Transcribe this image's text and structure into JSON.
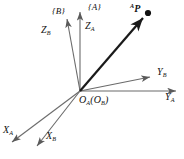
{
  "figure": {
    "background_color": "#ffffff",
    "axis_color": "#6b6b6b",
    "vector_color": "#1a1a1a",
    "text_color": "#111111",
    "width": 184,
    "height": 159
  },
  "frames": [
    {
      "id": "A",
      "label": "{A}",
      "x": 88,
      "y": 4
    },
    {
      "id": "B",
      "label": "{B}",
      "x": 52,
      "y": 7
    }
  ],
  "origin": {
    "label_o_a": "O",
    "sub_a": "A",
    "label_paren_open": "(O",
    "sub_b": "B",
    "label_paren_close": ")",
    "full_label": "OA(OB)",
    "x": 80,
    "y": 91
  },
  "point": {
    "label_sup": "A",
    "label_main": "P",
    "full_label": "AP",
    "marker_x": 148,
    "marker_y": 13,
    "label_x": 130,
    "label_y": 3
  },
  "axes": [
    {
      "name": "Z_A",
      "label_main": "Z",
      "label_sub": "A",
      "frame": "A",
      "tip_x": 80,
      "tip_y": 10,
      "label_x": 84,
      "label_y": 22
    },
    {
      "name": "Z_B",
      "label_main": "Z",
      "label_sub": "B",
      "frame": "B",
      "tip_x": 66,
      "tip_y": 16,
      "label_x": 42,
      "label_y": 26
    },
    {
      "name": "Y_A",
      "label_main": "Y",
      "label_sub": "A",
      "frame": "A",
      "tip_x": 178,
      "tip_y": 91,
      "label_x": 166,
      "label_y": 95
    },
    {
      "name": "Y_B",
      "label_main": "Y",
      "label_sub": "B",
      "frame": "B",
      "tip_x": 153,
      "tip_y": 76,
      "label_x": 157,
      "label_y": 70
    },
    {
      "name": "X_A",
      "label_main": "X",
      "label_sub": "A",
      "frame": "A",
      "tip_x": 9,
      "tip_y": 144,
      "label_x": 4,
      "label_y": 127
    },
    {
      "name": "X_B",
      "label_main": "X",
      "label_sub": "B",
      "frame": "B",
      "tip_x": 34,
      "tip_y": 148,
      "label_x": 46,
      "label_y": 132
    }
  ],
  "vector": {
    "name": "position-vector-to-P",
    "from_x": 80,
    "from_y": 91,
    "to_x": 145,
    "to_y": 16,
    "stroke_width": 2.2
  }
}
